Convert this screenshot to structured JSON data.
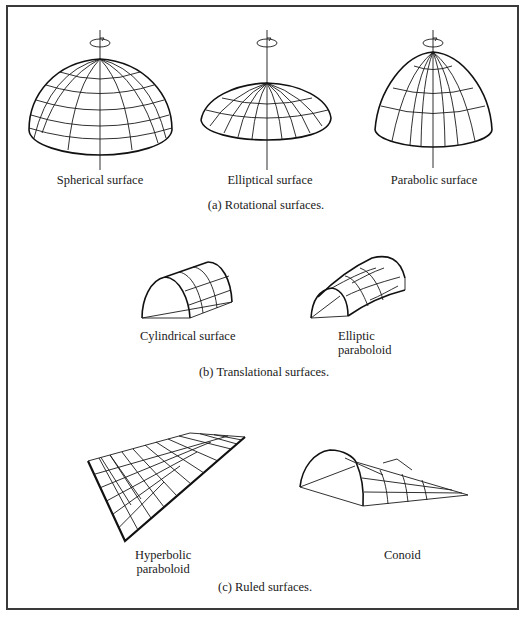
{
  "figure": {
    "sections": [
      {
        "caption": "(a)  Rotational surfaces.",
        "items": [
          {
            "label": "Spherical surface",
            "icon": "rotation-arrow-icon"
          },
          {
            "label": "Elliptical surface",
            "icon": "rotation-arrow-icon"
          },
          {
            "label": "Parabolic surface",
            "icon": "rotation-arrow-icon"
          }
        ]
      },
      {
        "caption": "(b)  Translational surfaces.",
        "items": [
          {
            "label": "Cylindrical surface"
          },
          {
            "label_line1": "Elliptic",
            "label_line2": "paraboloid"
          }
        ]
      },
      {
        "caption": "(c)  Ruled surfaces.",
        "items": [
          {
            "label_line1": "Hyperbolic",
            "label_line2": "paraboloid"
          },
          {
            "label": "Conoid"
          }
        ]
      }
    ],
    "colors": {
      "line": "#1a1a1a",
      "frame": "#3a3a3a",
      "background": "#ffffff"
    }
  }
}
